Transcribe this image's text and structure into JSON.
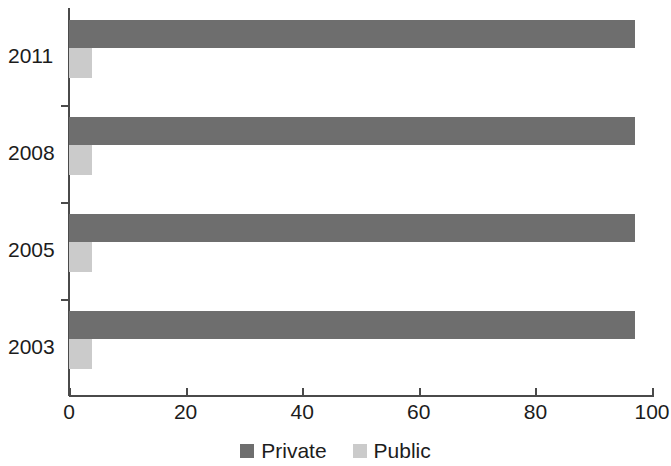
{
  "chart_data": {
    "type": "bar",
    "orientation": "horizontal",
    "title": "",
    "subtitle": "",
    "xlabel": "",
    "ylabel": "",
    "categories": [
      "2011",
      "2008",
      "2005",
      "2003"
    ],
    "series": [
      {
        "name": "Private",
        "color": "#6e6e6e",
        "values": [
          97,
          97,
          97,
          97
        ]
      },
      {
        "name": "Public",
        "color": "#cbcbcb",
        "values": [
          4,
          4,
          4,
          4
        ]
      }
    ],
    "xlim": [
      0,
      100
    ],
    "xticks": [
      0,
      20,
      40,
      60,
      80,
      100
    ],
    "xtick_labels": [
      "0",
      "20",
      "40",
      "60",
      "80",
      "100"
    ],
    "ytick_labels": [
      "2011",
      "2008",
      "2005",
      "2003"
    ],
    "grid": false,
    "legend": {
      "position": "bottom",
      "entries": [
        {
          "label": "Private",
          "color": "#6e6e6e"
        },
        {
          "label": "Public",
          "color": "#cbcbcb"
        }
      ]
    }
  },
  "axes": {
    "x_ticks": [
      {
        "label": "0",
        "value": 0
      },
      {
        "label": "20",
        "value": 20
      },
      {
        "label": "40",
        "value": 40
      },
      {
        "label": "60",
        "value": 60
      },
      {
        "label": "80",
        "value": 80
      },
      {
        "label": "100",
        "value": 100
      }
    ],
    "y_groups": [
      {
        "label": "2011",
        "private": 97,
        "public": 4
      },
      {
        "label": "2008",
        "private": 97,
        "public": 4
      },
      {
        "label": "2005",
        "private": 97,
        "public": 4
      },
      {
        "label": "2003",
        "private": 97,
        "public": 4
      }
    ]
  },
  "colors": {
    "private": "#6e6e6e",
    "public": "#cbcbcb",
    "axis": "#4a4a4a",
    "text": "#1c1c1c",
    "background": "#ffffff"
  }
}
